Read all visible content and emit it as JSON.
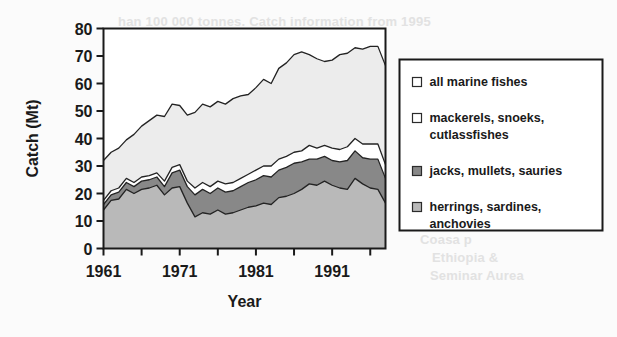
{
  "chart_data": {
    "type": "area",
    "title": "",
    "xlabel": "Year",
    "ylabel": "Catch (Mt)",
    "xlim": [
      1961,
      1998
    ],
    "ylim": [
      0,
      80
    ],
    "ytick_labels": [
      "0",
      "10",
      "20",
      "30",
      "40",
      "50",
      "60",
      "70",
      "80"
    ],
    "ytick_values": [
      0,
      10,
      20,
      30,
      40,
      50,
      60,
      70,
      80
    ],
    "xtick_labels": [
      "1961",
      "1971",
      "1981",
      "1991"
    ],
    "xtick_values": [
      1961,
      1971,
      1981,
      1991
    ],
    "xtick_minor_values": [
      1966,
      1976,
      1986,
      1996
    ],
    "grid": false,
    "legend_position": "right",
    "stacking": "cumulative-overlaid",
    "x": [
      1961,
      1962,
      1963,
      1964,
      1965,
      1966,
      1967,
      1968,
      1969,
      1970,
      1971,
      1972,
      1973,
      1974,
      1975,
      1976,
      1977,
      1978,
      1979,
      1980,
      1981,
      1982,
      1983,
      1984,
      1985,
      1986,
      1987,
      1988,
      1989,
      1990,
      1991,
      1992,
      1993,
      1994,
      1995,
      1996,
      1997,
      1998
    ],
    "series": [
      {
        "name": "herrings, sardines, anchovies",
        "color": "#b9b9b9",
        "swatch": "light-gray",
        "values": [
          14.0,
          17.5,
          18.0,
          21.5,
          20.0,
          21.5,
          22.0,
          23.0,
          19.5,
          22.0,
          22.5,
          16.5,
          11.5,
          13.0,
          12.5,
          14.0,
          12.5,
          13.0,
          14.0,
          15.0,
          15.5,
          16.5,
          16.0,
          18.5,
          19.0,
          20.0,
          21.5,
          23.5,
          23.0,
          24.5,
          23.0,
          22.0,
          21.5,
          25.5,
          23.5,
          22.0,
          21.5,
          16.5
        ]
      },
      {
        "name": "jacks, mullets, sauries",
        "color": "#888888",
        "swatch": "dark-gray",
        "values": [
          16.0,
          19.5,
          20.5,
          24.0,
          22.5,
          24.5,
          25.0,
          26.0,
          22.5,
          27.5,
          28.5,
          22.5,
          19.5,
          21.5,
          20.0,
          22.0,
          20.5,
          21.0,
          22.5,
          24.0,
          25.0,
          26.5,
          26.0,
          28.5,
          29.5,
          31.0,
          31.5,
          32.5,
          32.5,
          33.5,
          32.0,
          31.5,
          32.0,
          35.5,
          33.0,
          32.5,
          32.5,
          25.5
        ]
      },
      {
        "name": "mackerels, snoeks, cutlassfishes",
        "color": "#ffffff",
        "swatch": "white",
        "values": [
          17.5,
          21.0,
          22.0,
          25.5,
          24.0,
          26.0,
          26.5,
          27.5,
          24.5,
          29.5,
          30.5,
          24.5,
          22.0,
          24.0,
          22.5,
          24.5,
          23.5,
          24.0,
          25.5,
          27.0,
          28.5,
          30.0,
          30.0,
          32.5,
          33.5,
          35.0,
          35.5,
          37.5,
          36.5,
          37.5,
          36.5,
          36.0,
          37.0,
          40.0,
          38.0,
          38.0,
          38.0,
          30.5
        ]
      },
      {
        "name": "all marine fishes",
        "color": "#ececec",
        "swatch": "white",
        "values": [
          32.0,
          35.0,
          36.5,
          39.5,
          41.5,
          44.5,
          46.5,
          48.5,
          48.0,
          52.5,
          52.0,
          48.5,
          49.5,
          52.5,
          51.5,
          53.5,
          52.5,
          54.5,
          55.5,
          56.0,
          58.5,
          61.5,
          60.0,
          65.5,
          67.5,
          70.5,
          71.5,
          70.5,
          69.0,
          68.0,
          68.5,
          70.5,
          71.0,
          73.0,
          72.5,
          73.5,
          73.5,
          66.5
        ]
      }
    ],
    "legend_entries": [
      {
        "label_line1": "all marine fishes",
        "label_line2": "",
        "swatch": "white"
      },
      {
        "label_line1": "mackerels, snoeks,",
        "label_line2": "cutlassfishes",
        "swatch": "white"
      },
      {
        "label_line1": "jacks, mullets, sauries",
        "label_line2": "",
        "swatch": "dark-gray"
      },
      {
        "label_line1": "herrings, sardines,",
        "label_line2": "anchovies",
        "swatch": "light-gray"
      }
    ]
  },
  "background_showthrough": {
    "top_line": "han 100 000 tonnes.  Catch information from 1995",
    "line_a": "9999",
    "line_b": "Coasa p",
    "line_c": "Ethiopia &",
    "line_d": "Seminar Aurea"
  },
  "colors": {
    "axis": "#1a1a1a",
    "plot_background": "#ffffff",
    "page_background": "#fbfbfb",
    "band_all_marine": "#ececec",
    "band_mackerels": "#ffffff",
    "band_jacks": "#888888",
    "band_herrings": "#b9b9b9"
  }
}
